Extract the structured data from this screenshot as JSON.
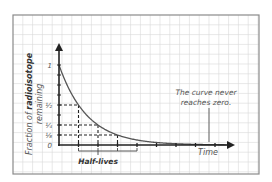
{
  "chart_data": {
    "type": "line",
    "title": "",
    "xlabel": "Time",
    "ylabel_prefix": "Fraction of",
    "ylabel_bold": "radioisotope",
    "ylabel_suffix": "remaining",
    "bracket_label": "Half-lives",
    "y_ticks": [
      {
        "label": "1",
        "value": 1
      },
      {
        "label": "½",
        "value": 0.5
      },
      {
        "label": "¼",
        "value": 0.25
      },
      {
        "label": "⅛",
        "value": 0.125
      },
      {
        "label": "0",
        "value": 0
      }
    ],
    "x": [
      0,
      1,
      2,
      3,
      4,
      5,
      6,
      7
    ],
    "values": [
      1,
      0.5,
      0.25,
      0.125,
      0.0625,
      0.03125,
      0.015625,
      0.0078125
    ],
    "half_life_markers": [
      {
        "half_lives": 1,
        "fraction": 0.5
      },
      {
        "half_lives": 2,
        "fraction": 0.25
      },
      {
        "half_lives": 3,
        "fraction": 0.125
      }
    ],
    "annotation": {
      "line1": "The curve never",
      "line2": "reaches zero."
    },
    "grid": true,
    "ylim": [
      0,
      1
    ],
    "xlim": [
      0,
      8
    ]
  },
  "colors": {
    "grid": "#d8d8d8",
    "frame": "#8a8a8a",
    "axis": "#222222",
    "curve": "#555555",
    "text": "#555555"
  }
}
